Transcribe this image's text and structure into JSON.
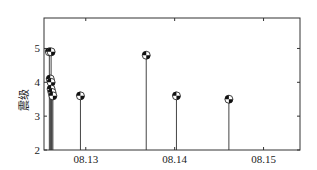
{
  "chart_data": {
    "type": "scatter",
    "subtype": "stem",
    "title": "",
    "xlabel": "",
    "ylabel": "震级",
    "xlim": [
      12.53,
      15.41
    ],
    "ylim": [
      2,
      5.9
    ],
    "x_ticks": [
      {
        "value": 13,
        "label": "08.13"
      },
      {
        "value": 14,
        "label": "08.14"
      },
      {
        "value": 15,
        "label": "08.15"
      }
    ],
    "y_ticks": [
      {
        "value": 2,
        "label": "2"
      },
      {
        "value": 3,
        "label": "3"
      },
      {
        "value": 4,
        "label": "4"
      },
      {
        "value": 5,
        "label": "5"
      }
    ],
    "grid": false,
    "legend": null,
    "series": [
      {
        "name": "events",
        "points": [
          {
            "x": 12.59,
            "y": 4.9
          },
          {
            "x": 12.61,
            "y": 4.9
          },
          {
            "x": 12.6,
            "y": 4.1
          },
          {
            "x": 12.61,
            "y": 4.0
          },
          {
            "x": 12.61,
            "y": 3.8
          },
          {
            "x": 12.62,
            "y": 3.7
          },
          {
            "x": 12.63,
            "y": 3.6
          },
          {
            "x": 12.94,
            "y": 3.6
          },
          {
            "x": 13.68,
            "y": 4.8
          },
          {
            "x": 14.02,
            "y": 3.6
          },
          {
            "x": 14.61,
            "y": 3.5
          }
        ]
      }
    ]
  }
}
